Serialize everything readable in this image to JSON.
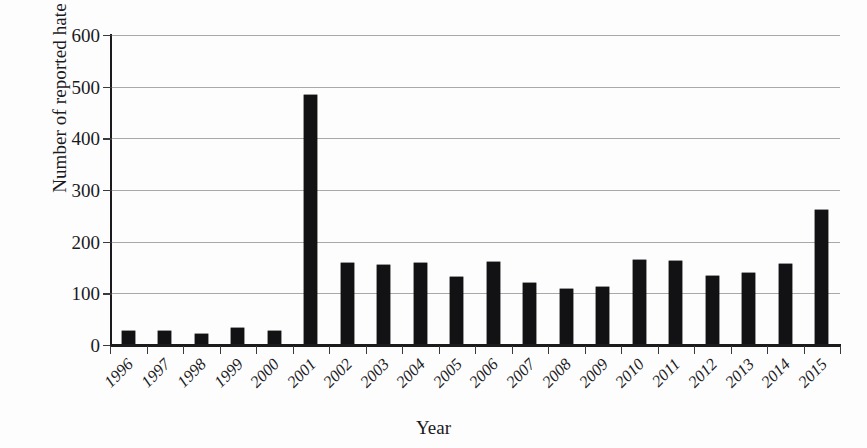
{
  "chart_data": {
    "type": "bar",
    "title": "",
    "xlabel": "Year",
    "ylabel": "Number of reported hate crimes",
    "categories": [
      "1996",
      "1997",
      "1998",
      "1999",
      "2000",
      "2001",
      "2002",
      "2003",
      "2004",
      "2005",
      "2006",
      "2007",
      "2008",
      "2009",
      "2010",
      "2011",
      "2012",
      "2013",
      "2014",
      "2015"
    ],
    "values": [
      28,
      28,
      21,
      33,
      28,
      483,
      158,
      154,
      159,
      132,
      160,
      120,
      108,
      112,
      164,
      163,
      134,
      139,
      157,
      262
    ],
    "ylim": [
      0,
      600
    ],
    "yticks": [
      0,
      100,
      200,
      300,
      400,
      500,
      600
    ],
    "ytick_labels": [
      "0",
      "100",
      "200",
      "300",
      "400",
      "500",
      "600"
    ],
    "grid": true,
    "grid_axis": "y",
    "legend": "none",
    "bar_color": "#121113",
    "gridline_color": "#a9a8aa",
    "axis_color": "#1b1a1d",
    "background_color": "#fdfdfd",
    "series": [
      {
        "name": "Reported hate crimes",
        "values": [
          28,
          28,
          21,
          33,
          28,
          483,
          158,
          154,
          159,
          132,
          160,
          120,
          108,
          112,
          164,
          163,
          134,
          139,
          157,
          262
        ]
      }
    ]
  }
}
